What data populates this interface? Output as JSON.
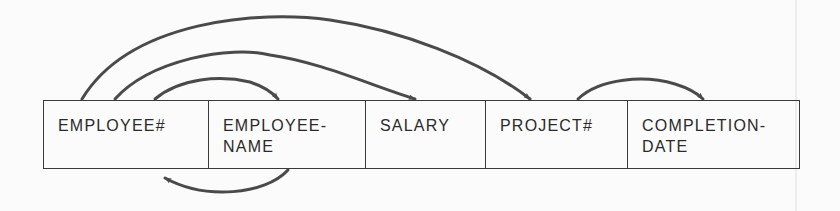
{
  "diagram": {
    "type": "functional-dependency",
    "stroke_color": "#4a4a4a",
    "box_border_color": "#3a3a3a",
    "fields": [
      {
        "id": "employee_no",
        "label": "EMPLOYEE#",
        "width": 165
      },
      {
        "id": "employee_name",
        "label": "EMPLOYEE-\nNAME",
        "width": 157
      },
      {
        "id": "salary",
        "label": "SALARY",
        "width": 120
      },
      {
        "id": "project_no",
        "label": "PROJECT#",
        "width": 142
      },
      {
        "id": "completion_date",
        "label": "COMPLETION-\nDATE",
        "width": 171
      }
    ],
    "dependencies": [
      {
        "from": "EMPLOYEE#",
        "to": "EMPLOYEE-NAME",
        "side": "top"
      },
      {
        "from": "EMPLOYEE#",
        "to": "SALARY",
        "side": "top"
      },
      {
        "from": "EMPLOYEE#",
        "to": "PROJECT#",
        "side": "top"
      },
      {
        "from": "PROJECT#",
        "to": "COMPLETION-DATE",
        "side": "top"
      },
      {
        "from": "EMPLOYEE-NAME",
        "to": "EMPLOYEE#",
        "side": "bottom"
      }
    ]
  }
}
